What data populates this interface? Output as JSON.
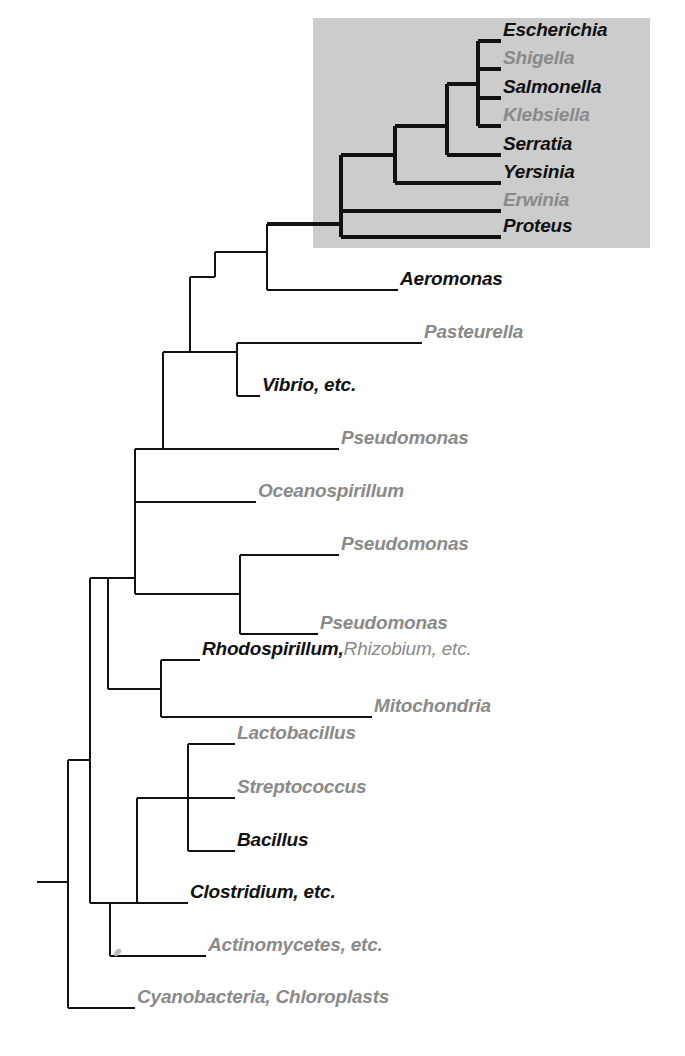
{
  "figure": {
    "kind": "phylogenetic-tree",
    "width": 685,
    "height": 1056,
    "background_color": "#ffffff",
    "line_color": "#111111",
    "highlight_box": {
      "label": "enterobacteria-highlight",
      "color": "#cccccc",
      "x": 313,
      "y": 18,
      "width": 337,
      "height": 230
    }
  },
  "taxa": [
    {
      "id": "escherichia",
      "text": "Escherichia",
      "style": "bold",
      "x": 503,
      "y": 31,
      "size": 19
    },
    {
      "id": "shigella",
      "text": "Shigella",
      "style": "gray",
      "x": 503,
      "y": 59,
      "size": 19
    },
    {
      "id": "salmonella",
      "text": "Salmonella",
      "style": "bold",
      "x": 503,
      "y": 88,
      "size": 19
    },
    {
      "id": "klebsiella",
      "text": "Klebsiella",
      "style": "gray",
      "x": 503,
      "y": 116,
      "size": 19
    },
    {
      "id": "serratia",
      "text": "Serratia",
      "style": "bold",
      "x": 503,
      "y": 145,
      "size": 19
    },
    {
      "id": "yersinia",
      "text": "Yersinia",
      "style": "bold",
      "x": 503,
      "y": 173,
      "size": 19
    },
    {
      "id": "erwinia",
      "text": "Erwinia",
      "style": "gray",
      "x": 503,
      "y": 201,
      "size": 19
    },
    {
      "id": "proteus",
      "text": "Proteus",
      "style": "bold",
      "x": 503,
      "y": 227,
      "size": 19
    },
    {
      "id": "aeromonas",
      "text": "Aeromonas",
      "style": "bold",
      "x": 400,
      "y": 280,
      "size": 19
    },
    {
      "id": "pasteurella",
      "text": "Pasteurella",
      "style": "gray",
      "x": 424,
      "y": 333,
      "size": 19
    },
    {
      "id": "vibrio",
      "text": "Vibrio, etc.",
      "style": "bold",
      "x": 262,
      "y": 388,
      "size": 19
    },
    {
      "id": "pseudomonas-1",
      "text": "Pseudomonas",
      "style": "gray",
      "x": 341,
      "y": 441,
      "size": 19
    },
    {
      "id": "oceanospirillum",
      "text": "Oceanospirillum",
      "style": "gray",
      "x": 258,
      "y": 494,
      "size": 19
    },
    {
      "id": "pseudomonas-2",
      "text": "Pseudomonas",
      "style": "gray",
      "x": 341,
      "y": 547,
      "size": 19
    },
    {
      "id": "pseudomonas-3",
      "text": "Pseudomonas",
      "style": "gray",
      "x": 320,
      "y": 625,
      "size": 19
    },
    {
      "id": "rhodospirillum",
      "text": "Rhodospirillum,",
      "style": "mixed-bold",
      "x": 202,
      "y": 651,
      "size": 19
    },
    {
      "id": "rhizobium",
      "text": "Rhizobium, etc.",
      "style": "mixed-gray",
      "x": 0,
      "y": 0,
      "size": 19
    },
    {
      "id": "mitochondria",
      "text": "Mitochondria",
      "style": "gray",
      "x": 374,
      "y": 708,
      "size": 19
    },
    {
      "id": "lactobacillus",
      "text": "Lactobacillus",
      "style": "gray",
      "x": 237,
      "y": 735,
      "size": 19
    },
    {
      "id": "streptococcus",
      "text": "Streptococcus",
      "style": "gray",
      "x": 237,
      "y": 789,
      "size": 19
    },
    {
      "id": "bacillus",
      "text": "Bacillus",
      "style": "bold",
      "x": 237,
      "y": 842,
      "size": 19
    },
    {
      "id": "clostridium",
      "text": "Clostridium, etc.",
      "style": "bold",
      "x": 190,
      "y": 894,
      "size": 19
    },
    {
      "id": "actinomycetes",
      "text": "Actinomycetes, etc.",
      "style": "gray",
      "x": 208,
      "y": 947,
      "size": 19
    },
    {
      "id": "cyanobacteria",
      "text": "Cyanobacteria, Chloroplasts",
      "style": "gray",
      "x": 137,
      "y": 999,
      "size": 19
    }
  ],
  "tree": {
    "stroke_width_thick": 4.5,
    "stroke_width_thin": 2.4,
    "tips": [
      {
        "id": "escherichia",
        "y": 41,
        "x_start": 478,
        "x_end": 501,
        "weight": "thick"
      },
      {
        "id": "shigella",
        "y": 69,
        "x_start": 478,
        "x_end": 501,
        "weight": "thick"
      },
      {
        "id": "salmonella",
        "y": 98,
        "x_start": 504,
        "x_end": 501,
        "weight": "thick"
      },
      {
        "id": "klebsiella",
        "y": 126,
        "x_start": 504,
        "x_end": 501,
        "weight": "thick"
      },
      {
        "id": "serratia",
        "y": 155,
        "x_start": 447,
        "x_end": 501,
        "weight": "thick"
      },
      {
        "id": "yersinia",
        "y": 183,
        "x_start": 395,
        "x_end": 501,
        "weight": "thick"
      },
      {
        "id": "erwinia",
        "y": 211,
        "x_start": 341,
        "x_end": 501,
        "weight": "thick"
      },
      {
        "id": "proteus",
        "y": 237,
        "x_start": 341,
        "x_end": 501,
        "weight": "thick"
      },
      {
        "id": "aeromonas",
        "y": 290,
        "x_start": 267,
        "x_end": 398,
        "weight": "thick"
      },
      {
        "id": "pasteurella",
        "y": 343,
        "x_start": 237,
        "x_end": 422,
        "weight": "thin"
      },
      {
        "id": "vibrio",
        "y": 396,
        "x_start": 237,
        "x_end": 260,
        "weight": "thin"
      },
      {
        "id": "pseudomonas-1",
        "y": 449,
        "x_start": 163,
        "x_end": 339,
        "weight": "thin"
      },
      {
        "id": "oceanospirillum",
        "y": 502,
        "x_start": 135,
        "x_end": 256,
        "weight": "thin"
      },
      {
        "id": "pseudomonas-2",
        "y": 555,
        "x_start": 240,
        "x_end": 339,
        "weight": "thin"
      },
      {
        "id": "pseudomonas-3",
        "y": 634,
        "x_start": 240,
        "x_end": 318,
        "weight": "thin"
      },
      {
        "id": "rhodospirillum",
        "y": 660,
        "x_start": 161,
        "x_end": 200,
        "weight": "thin"
      },
      {
        "id": "mitochondria",
        "y": 717,
        "x_start": 161,
        "x_end": 372,
        "weight": "thin"
      },
      {
        "id": "lactobacillus",
        "y": 744,
        "x_start": 188,
        "x_end": 235,
        "weight": "thin"
      },
      {
        "id": "streptococcus",
        "y": 798,
        "x_start": 188,
        "x_end": 235,
        "weight": "thin"
      },
      {
        "id": "bacillus",
        "y": 851,
        "x_start": 188,
        "x_end": 235,
        "weight": "thin"
      },
      {
        "id": "clostridium",
        "y": 903,
        "x_start": 137,
        "x_end": 188,
        "weight": "thin"
      },
      {
        "id": "actinomycetes",
        "y": 956,
        "x_start": 110,
        "x_end": 206,
        "weight": "thin"
      },
      {
        "id": "cyanobacteria",
        "y": 1008,
        "x_start": 68,
        "x_end": 135,
        "weight": "thin"
      }
    ]
  }
}
